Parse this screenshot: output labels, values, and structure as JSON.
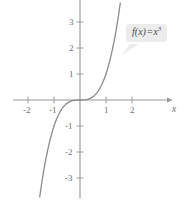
{
  "chart_data": {
    "type": "line",
    "title": "",
    "xlabel": "x",
    "ylabel": "",
    "function_label": "f(x) = x³",
    "function_expression": "x^3",
    "xlim": [
      -2.6,
      3.4
    ],
    "ylim": [
      -3.9,
      3.9
    ],
    "grid": false,
    "legend_position": "inline-callout",
    "x_ticks": [
      -2,
      -1,
      1,
      2
    ],
    "x_tick_labels": [
      "-2",
      "-1",
      "1",
      "2"
    ],
    "y_ticks": [
      3,
      2,
      1,
      -1,
      -2,
      -3
    ],
    "y_tick_labels": [
      "3",
      "2",
      "1",
      "-1",
      "-2",
      "-3"
    ],
    "series": [
      {
        "name": "f(x) = x³",
        "color": "#8a8a8a",
        "x": [
          -1.55,
          -1.45,
          -1.35,
          -1.25,
          -1.15,
          -1.05,
          -0.95,
          -0.85,
          -0.75,
          -0.65,
          -0.55,
          -0.45,
          -0.35,
          -0.25,
          -0.15,
          -0.05,
          0.05,
          0.15,
          0.25,
          0.35,
          0.45,
          0.55,
          0.65,
          0.75,
          0.85,
          0.95,
          1.05,
          1.15,
          1.25,
          1.35,
          1.45,
          1.55
        ],
        "y": [
          -3.724,
          -3.048,
          -2.46,
          -1.953,
          -1.521,
          -1.158,
          -0.857,
          -0.614,
          -0.422,
          -0.275,
          -0.166,
          -0.091,
          -0.043,
          -0.016,
          -0.003,
          0.0,
          0.0,
          0.003,
          0.016,
          0.043,
          0.091,
          0.166,
          0.275,
          0.422,
          0.614,
          0.857,
          1.158,
          1.521,
          1.953,
          2.46,
          3.048,
          3.724
        ]
      }
    ]
  },
  "axes": {
    "x_axis_label": "x",
    "x_tick_labels": [
      "-2",
      "-1",
      "1",
      "2"
    ],
    "y_tick_labels": [
      "3",
      "2",
      "1",
      "-1",
      "-2",
      "-3"
    ],
    "axis_color": "#9a9a9a",
    "tick_label_color": "#6e6e6e"
  },
  "callout": {
    "fn_name": "f",
    "open_paren": "(",
    "arg": "x",
    "close_paren": ")",
    "equals": "=",
    "base": "x",
    "exponent": "3",
    "full_text": "f(x) = x³",
    "background_color": "#ececec",
    "text_color": "#4a4a4a"
  }
}
